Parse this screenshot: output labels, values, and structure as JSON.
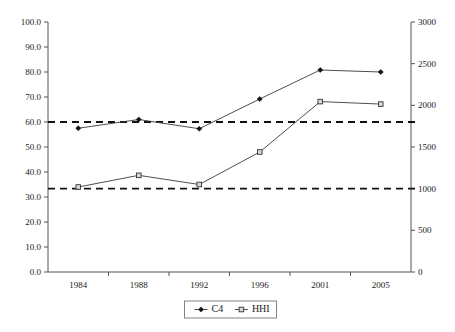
{
  "chart_data": {
    "type": "line",
    "title": "",
    "subtitle": "",
    "xlabel": "",
    "ylabel": "",
    "categories": [
      "1984",
      "1988",
      "1992",
      "1996",
      "2001",
      "2005"
    ],
    "series": [
      {
        "name": "C4",
        "axis": "left",
        "marker": "diamond",
        "values": [
          57.5,
          61.0,
          57.3,
          69.2,
          80.8,
          80.0
        ]
      },
      {
        "name": "HHI",
        "axis": "right",
        "marker": "square",
        "values": [
          1020,
          1160,
          1050,
          1440,
          2045,
          2015
        ]
      }
    ],
    "reference_lines": [
      {
        "name": "c4-threshold",
        "axis": "left",
        "value": 60.0,
        "style": "dashed"
      },
      {
        "name": "hhi-threshold",
        "axis": "right",
        "value": 1000,
        "style": "dashed"
      }
    ],
    "left_axis": {
      "min": 0.0,
      "max": 100.0,
      "step": 10.0,
      "ticks": [
        "0.0",
        "10.0",
        "20.0",
        "30.0",
        "40.0",
        "50.0",
        "60.0",
        "70.0",
        "80.0",
        "90.0",
        "100.0"
      ]
    },
    "right_axis": {
      "min": 0,
      "max": 3000,
      "step": 500,
      "ticks": [
        "0",
        "500",
        "1000",
        "1500",
        "2000",
        "2500",
        "3000"
      ]
    },
    "legend": {
      "position": "bottom",
      "entries": [
        {
          "label": "C4",
          "marker": "diamond"
        },
        {
          "label": "HHI",
          "marker": "square"
        }
      ]
    },
    "grid": false,
    "colors": {
      "line": "#3a3a3a",
      "axis": "#555555",
      "reference": "#111111",
      "marker_c4_fill": "#111111",
      "marker_hhi_fill": "#d9d9d9",
      "text": "#1a1a1a",
      "background": "#ffffff"
    }
  }
}
